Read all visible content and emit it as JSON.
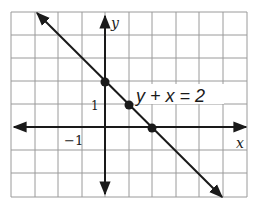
{
  "figure": {
    "equation_label": "y + x = 2",
    "x_axis_label": "x",
    "y_axis_label": "y",
    "tick_labels": {
      "y_one": "1",
      "x_neg_one": "−1"
    },
    "grid": {
      "columns": 10,
      "rows": 8,
      "x_min": -4,
      "x_max": 6,
      "y_min": -3,
      "y_max": 5
    },
    "line": {
      "slope": -1,
      "intercept": 2
    },
    "points": [
      {
        "x": 0,
        "y": 2
      },
      {
        "x": 1,
        "y": 1
      },
      {
        "x": 2,
        "y": 0
      }
    ],
    "colors": {
      "grid": "#9a9a9a",
      "axis": "#1a1a1a",
      "line": "#1a1a1a",
      "background": "#ffffff"
    }
  }
}
